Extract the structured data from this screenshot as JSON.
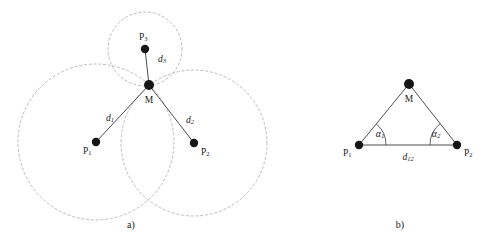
{
  "figure": {
    "background_color": "#ffffff",
    "ink_color": "#1a1a1a",
    "line_color": "#4d4d4d",
    "circle_color": "#b3b3b3",
    "dot_color": "#161616",
    "captions": {
      "panel_a": "a)",
      "panel_b": "b)"
    }
  },
  "panel_a": {
    "name": "trilateration-three-circles",
    "points": [
      {
        "id": "P1",
        "label": "P",
        "subscript": "1",
        "x": 96,
        "y": 142,
        "radius": 4.2
      },
      {
        "id": "P2",
        "label": "P",
        "subscript": "2",
        "x": 194,
        "y": 143,
        "radius": 4.2
      },
      {
        "id": "P3",
        "label": "P",
        "subscript": "3",
        "x": 145,
        "y": 49,
        "radius": 4.2
      },
      {
        "id": "M",
        "label": "M",
        "subscript": "",
        "x": 149,
        "y": 85,
        "radius": 5.0
      }
    ],
    "point_labels": [
      {
        "id": "P1",
        "text": "P",
        "sub": "1",
        "x": 83,
        "y": 147
      },
      {
        "id": "P2",
        "text": "P",
        "sub": "2",
        "x": 201,
        "y": 148
      },
      {
        "id": "P3",
        "text": "P",
        "sub": "3",
        "x": 139,
        "y": 33
      },
      {
        "id": "M",
        "text": "M",
        "sub": "",
        "x": 149,
        "y": 100
      }
    ],
    "circles": [
      {
        "center": "P1",
        "cx": 96,
        "cy": 142,
        "r": 78
      },
      {
        "center": "P2",
        "cx": 194,
        "cy": 143,
        "r": 73
      },
      {
        "center": "P3",
        "cx": 145,
        "cy": 49,
        "r": 37
      }
    ],
    "segments": [
      {
        "id": "d1",
        "from": "P1",
        "to": "M",
        "x1": 96,
        "y1": 142,
        "x2": 149,
        "y2": 85
      },
      {
        "id": "d2",
        "from": "P2",
        "to": "M",
        "x1": 194,
        "y1": 143,
        "x2": 149,
        "y2": 85
      },
      {
        "id": "d3",
        "from": "P3",
        "to": "M",
        "x1": 145,
        "y1": 49,
        "x2": 149,
        "y2": 85
      }
    ],
    "distance_labels": [
      {
        "id": "d1",
        "text": "d",
        "sub": "1",
        "x": 106,
        "y": 114
      },
      {
        "id": "d2",
        "text": "d",
        "sub": "2",
        "x": 186,
        "y": 116
      },
      {
        "id": "d3",
        "text": "d",
        "sub": "3",
        "x": 158,
        "y": 60
      }
    ]
  },
  "panel_b": {
    "name": "triangulation-angles",
    "points": [
      {
        "id": "P1",
        "label": "P",
        "subscript": "1",
        "x": 359,
        "y": 145,
        "radius": 4.2
      },
      {
        "id": "P2",
        "label": "P",
        "subscript": "2",
        "x": 457,
        "y": 145,
        "radius": 4.2
      },
      {
        "id": "M",
        "label": "M",
        "subscript": "",
        "x": 409,
        "y": 84,
        "radius": 5.0
      }
    ],
    "point_labels": [
      {
        "id": "P1",
        "text": "P",
        "sub": "1",
        "x": 344,
        "y": 149
      },
      {
        "id": "P2",
        "text": "P",
        "sub": "2",
        "x": 464,
        "y": 149
      },
      {
        "id": "M",
        "text": "M",
        "sub": "",
        "x": 409,
        "y": 99
      }
    ],
    "sides": [
      {
        "id": "P1-M",
        "x1": 359,
        "y1": 145,
        "x2": 409,
        "y2": 84
      },
      {
        "id": "M-P2",
        "x1": 409,
        "y1": 84,
        "x2": 457,
        "y2": 145
      },
      {
        "id": "P1-P2-baseline",
        "x1": 359,
        "y1": 145,
        "x2": 457,
        "y2": 145
      }
    ],
    "angles": [
      {
        "id": "alpha1",
        "text": "α",
        "sub": "1",
        "vertex": "P1",
        "x": 378,
        "y": 131
      },
      {
        "id": "alpha2",
        "text": "α",
        "sub": "2",
        "vertex": "P2",
        "x": 433,
        "y": 131
      }
    ],
    "baseline_label": {
      "id": "d12",
      "text": "d",
      "sub": "12",
      "x": 408,
      "y": 155
    }
  }
}
